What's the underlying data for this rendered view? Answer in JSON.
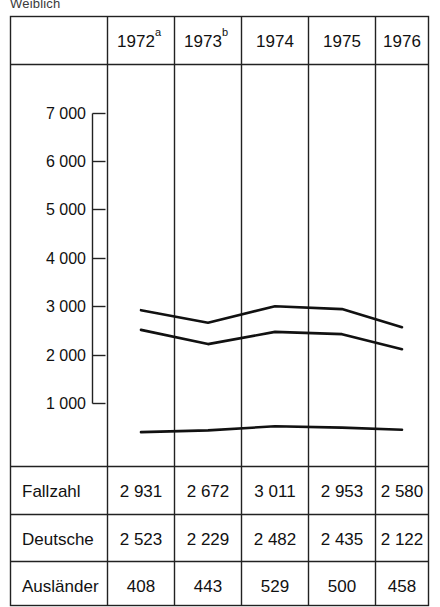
{
  "figure": {
    "caption_top": "Weiblich",
    "row_header_blank": ""
  },
  "chart_data": {
    "type": "line",
    "title": "Weiblich",
    "xlabel": "",
    "ylabel": "",
    "grid": true,
    "legend": "none",
    "categories": [
      "1972",
      "1973",
      "1974",
      "1975",
      "1976"
    ],
    "category_footnotes": [
      "a",
      "b",
      "",
      "",
      ""
    ],
    "ylim": [
      0,
      7000
    ],
    "yticks": [
      1000,
      2000,
      3000,
      4000,
      5000,
      6000,
      7000
    ],
    "ytick_labels": [
      "1 000",
      "2 000",
      "3 000",
      "4 000",
      "5 000",
      "6 000",
      "7 000"
    ],
    "series": [
      {
        "name": "Fallzahl",
        "values": [
          2931,
          2672,
          3011,
          2953,
          2580
        ],
        "display": [
          "2 931",
          "2 672",
          "3 011",
          "2 953",
          "2 580"
        ]
      },
      {
        "name": "Deutsche",
        "values": [
          2523,
          2229,
          2482,
          2435,
          2122
        ],
        "display": [
          "2 523",
          "2 229",
          "2 482",
          "2 435",
          "2 122"
        ]
      },
      {
        "name": "Ausländer",
        "values": [
          408,
          443,
          529,
          500,
          458
        ],
        "display": [
          "408",
          "443",
          "529",
          "500",
          "458"
        ]
      }
    ]
  },
  "table": {
    "header": {
      "corner": "",
      "columns": [
        "1972",
        "1973",
        "1974",
        "1975",
        "1976"
      ],
      "superscripts": [
        "a",
        "b",
        "",
        "",
        ""
      ]
    },
    "rows": [
      {
        "label": "Fallzahl",
        "cells": [
          "2 931",
          "2 672",
          "3 011",
          "2 953",
          "2 580"
        ]
      },
      {
        "label": "Deutsche",
        "cells": [
          "2 523",
          "2 229",
          "2 482",
          "2 435",
          "2 122"
        ]
      },
      {
        "label": "Ausländer",
        "cells": [
          "408",
          "443",
          "529",
          "500",
          "458"
        ]
      }
    ]
  },
  "colors": {
    "line": "#111111",
    "rule": "#222222",
    "background": "#ffffff"
  }
}
